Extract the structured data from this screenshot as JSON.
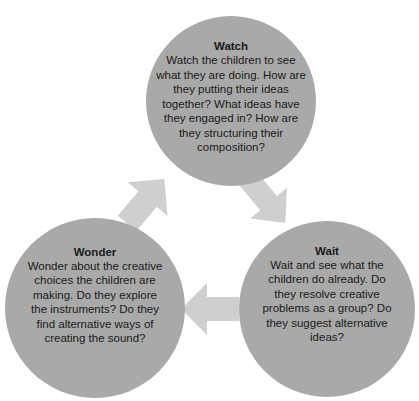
{
  "diagram": {
    "type": "cycle",
    "colors": {
      "circle": "#a9a9a9",
      "arrow": "#cfcfcf",
      "text": "#1a1a1a",
      "background": "#ffffff"
    },
    "nodes": [
      {
        "id": "watch",
        "title": "Watch",
        "body": "Watch the children to see what they are doing. How are they putting their ideas together? What ideas have they engaged in? How are they structuring their composition?"
      },
      {
        "id": "wait",
        "title": "Wait",
        "body": "Wait and see what the children do already. Do they resolve creative problems as a group? Do they suggest alternative ideas?"
      },
      {
        "id": "wonder",
        "title": "Wonder",
        "body": "Wonder about the creative choices the children are making. Do they explore the instruments? Do they find alternative ways of creating the sound?"
      }
    ],
    "arrows": [
      {
        "from": "watch",
        "to": "wait",
        "direction": "down-right"
      },
      {
        "from": "wait",
        "to": "wonder",
        "direction": "left"
      },
      {
        "from": "wonder",
        "to": "watch",
        "direction": "up-right"
      }
    ]
  }
}
